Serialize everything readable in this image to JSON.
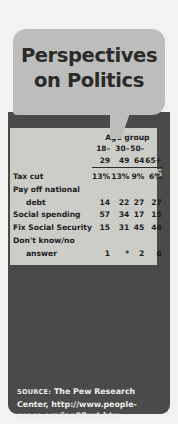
{
  "title": {
    "line1": "Perspectives",
    "line2": "on Politics",
    "full": "Perspectives\non Politics"
  },
  "section": {
    "heading": "GENERATIONAL DIVIDES"
  },
  "question": {
    "quote_open": "“",
    "quote_close": "”",
    "text": "What should the government do with the 1998 budget surplus?"
  },
  "table": {
    "group_header": "Age group",
    "columns": [
      "18–29",
      "30–49",
      "50–64",
      "65+"
    ],
    "rows": [
      {
        "label": "Tax cut",
        "label_line2": "",
        "indent": false,
        "values": [
          "13%",
          "13%",
          "9%",
          "6%"
        ]
      },
      {
        "label": "Pay off national",
        "label_line2": "debt",
        "indent": true,
        "values": [
          "14",
          "22",
          "27",
          "27"
        ]
      },
      {
        "label": "Social spending",
        "label_line2": "",
        "indent": false,
        "values": [
          "57",
          "34",
          "17",
          "15"
        ]
      },
      {
        "label": "Fix Social Security",
        "label_line2": "",
        "indent": false,
        "values": [
          "15",
          "31",
          "45",
          "46"
        ]
      },
      {
        "label": "Don't know/no",
        "label_line2": "answer",
        "indent": true,
        "values": [
          "1",
          "*",
          "2",
          "6"
        ]
      }
    ]
  },
  "source": {
    "label": "SOURCE:",
    "text": " The Pew Research Center, http://www.people-press.org/jan98rpt.htm."
  },
  "colors": {
    "page_background": "#f2f2f0",
    "bubble_gray": "#bdbdbb",
    "panel_dark": "#4a4a4a",
    "table_card": "#ccccc9",
    "heading_gray": "#b9b9b7",
    "text_light": "#f2f2f0",
    "text_dark": "#1c1c1c"
  },
  "chart_data": {
    "type": "table",
    "title": "What should the government do with the 1998 budget surplus?",
    "subtitle": "GENERATIONAL DIVIDES",
    "xlabel": "Age group",
    "ylabel": "Percent of respondents",
    "categories": [
      "18–29",
      "30–49",
      "50–64",
      "65+"
    ],
    "series": [
      {
        "name": "Tax cut",
        "values": [
          13,
          13,
          9,
          6
        ]
      },
      {
        "name": "Pay off national debt",
        "values": [
          14,
          22,
          27,
          27
        ]
      },
      {
        "name": "Social spending",
        "values": [
          57,
          34,
          17,
          15
        ]
      },
      {
        "name": "Fix Social Security",
        "values": [
          15,
          31,
          45,
          46
        ]
      },
      {
        "name": "Don't know/no answer",
        "values": [
          1,
          null,
          2,
          6
        ]
      }
    ],
    "annotations": [
      "* indicates less than 1 percent"
    ],
    "source": "The Pew Research Center, http://www.people-press.org/jan98rpt.htm.",
    "grid": false,
    "legend": "none"
  }
}
